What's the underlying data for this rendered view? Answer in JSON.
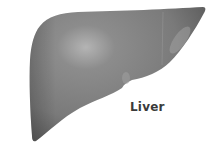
{
  "illustration": {
    "subject": "liver",
    "colors": {
      "organ_base": "#7d7d7d",
      "organ_dark": "#5e5e5e",
      "organ_highlight": "#b4b4b4",
      "background": "#ffffff",
      "label": "#3a3a3a"
    }
  },
  "label": {
    "text": "Liver"
  }
}
